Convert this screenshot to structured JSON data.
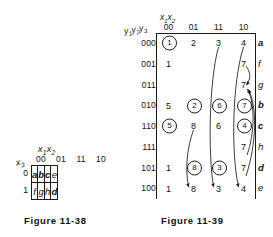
{
  "figure_38": {
    "caption": "Figure 11-38",
    "column_variable": "x1x2",
    "row_variable": "x3",
    "column_headers": [
      "00",
      "01",
      "11",
      "10"
    ],
    "row_headers": [
      "0",
      "1"
    ],
    "rows": [
      {
        "label": "0",
        "cells": [
          {
            "text": "a",
            "bold": true
          },
          {
            "text": "b",
            "bold": true
          },
          {
            "text": "c",
            "bold": true
          },
          {
            "text": "e",
            "bold": false
          }
        ]
      },
      {
        "label": "1",
        "cells": [
          {
            "text": "f",
            "bold": false
          },
          {
            "text": "g",
            "bold": false
          },
          {
            "text": "h",
            "bold": false
          },
          {
            "text": "d",
            "bold": true
          }
        ]
      }
    ]
  },
  "figure_39": {
    "caption": "Figure 11-39",
    "column_variable": "x1x2",
    "row_variable": "y1y2y3",
    "column_headers": [
      "00",
      "01",
      "11",
      "10"
    ],
    "row_headers": [
      "000",
      "001",
      "011",
      "010",
      "110",
      "111",
      "101",
      "100"
    ],
    "output_column": [
      {
        "text": "a",
        "bold": true
      },
      {
        "text": "f",
        "bold": false
      },
      {
        "text": "g",
        "bold": false
      },
      {
        "text": "b",
        "bold": true
      },
      {
        "text": "c",
        "bold": true
      },
      {
        "text": "h",
        "bold": false
      },
      {
        "text": "d",
        "bold": true
      },
      {
        "text": "e",
        "bold": false
      }
    ],
    "rows": [
      {
        "label": "000",
        "cells": [
          {
            "text": "1",
            "circled": true
          },
          {
            "text": "2",
            "circled": false
          },
          {
            "text": "3",
            "circled": false
          },
          {
            "text": "4",
            "circled": false
          }
        ]
      },
      {
        "label": "001",
        "cells": [
          {
            "text": "1",
            "circled": false
          },
          {
            "text": "",
            "circled": false
          },
          {
            "text": "",
            "circled": false
          },
          {
            "text": "7",
            "circled": false
          }
        ]
      },
      {
        "label": "011",
        "cells": [
          {
            "text": "",
            "circled": false
          },
          {
            "text": "",
            "circled": false
          },
          {
            "text": "",
            "circled": false
          },
          {
            "text": "7",
            "circled": false
          }
        ]
      },
      {
        "label": "010",
        "cells": [
          {
            "text": "5",
            "circled": false
          },
          {
            "text": "2",
            "circled": true
          },
          {
            "text": "6",
            "circled": true
          },
          {
            "text": "7",
            "circled": true
          }
        ]
      },
      {
        "label": "110",
        "cells": [
          {
            "text": "5",
            "circled": true
          },
          {
            "text": "8",
            "circled": false
          },
          {
            "text": "6",
            "circled": false
          },
          {
            "text": "4",
            "circled": true
          }
        ]
      },
      {
        "label": "111",
        "cells": [
          {
            "text": "",
            "circled": false
          },
          {
            "text": "",
            "circled": false
          },
          {
            "text": "",
            "circled": false
          },
          {
            "text": "7",
            "circled": false
          }
        ]
      },
      {
        "label": "101",
        "cells": [
          {
            "text": "1",
            "circled": false
          },
          {
            "text": "8",
            "circled": true
          },
          {
            "text": "3",
            "circled": true
          },
          {
            "text": "7",
            "circled": false
          }
        ]
      },
      {
        "label": "100",
        "cells": [
          {
            "text": "1",
            "circled": false
          },
          {
            "text": "8",
            "circled": false
          },
          {
            "text": "3",
            "circled": false
          },
          {
            "text": "4",
            "circled": false
          }
        ]
      }
    ]
  }
}
